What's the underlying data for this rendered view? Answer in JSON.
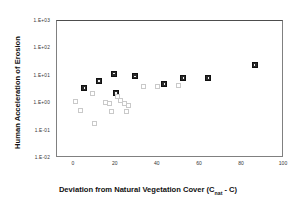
{
  "chart_data": {
    "type": "scatter",
    "title": "",
    "xlabel": "Deviation from Natural Vegetation Cover (Cnat -  C)",
    "xlabel_main": "Deviation from Natural Vegetation Cover (C",
    "xlabel_sub": "nat",
    "xlabel_tail": " -  C)",
    "ylabel": "Human Acceleration of Erosion",
    "xlim": [
      -8,
      100
    ],
    "ylim": [
      0.01,
      1000
    ],
    "yscale": "log",
    "xscale": "linear",
    "grid": false,
    "legend": "none",
    "xticks": [
      "0",
      "20",
      "40",
      "60",
      "80",
      "100"
    ],
    "xtick_values": [
      0,
      20,
      40,
      60,
      80,
      100
    ],
    "yticks": [
      "1.E+03",
      "1.E+02",
      "1.E+01",
      "1.E+00",
      "1.E-01",
      "1.E-02"
    ],
    "ytick_values": [
      1000,
      100,
      10,
      1,
      0.1,
      0.01
    ],
    "series": [
      {
        "name": "filled-squares",
        "marker": "filled-square",
        "color": "#2b2b2b",
        "points": [
          {
            "x": 5,
            "y": 3.6
          },
          {
            "x": 12,
            "y": 6.5
          },
          {
            "x": 19,
            "y": 12.0
          },
          {
            "x": 20,
            "y": 2.4
          },
          {
            "x": 29,
            "y": 9.5
          },
          {
            "x": 43,
            "y": 5.0
          },
          {
            "x": 52,
            "y": 8.5
          },
          {
            "x": 64,
            "y": 8.3
          },
          {
            "x": 86,
            "y": 25.0
          }
        ]
      },
      {
        "name": "open-squares",
        "marker": "open-square",
        "color": "#c9c9c9",
        "points": [
          {
            "x": 1,
            "y": 1.2
          },
          {
            "x": 3,
            "y": 0.55
          },
          {
            "x": 9,
            "y": 2.3
          },
          {
            "x": 10,
            "y": 0.18
          },
          {
            "x": 15,
            "y": 1.05
          },
          {
            "x": 17,
            "y": 0.95
          },
          {
            "x": 18,
            "y": 0.5
          },
          {
            "x": 21,
            "y": 1.8
          },
          {
            "x": 22,
            "y": 1.25
          },
          {
            "x": 24,
            "y": 1.0
          },
          {
            "x": 25,
            "y": 0.48
          },
          {
            "x": 26,
            "y": 0.85
          },
          {
            "x": 33,
            "y": 4.0
          },
          {
            "x": 40,
            "y": 4.2
          },
          {
            "x": 50,
            "y": 4.3
          }
        ]
      }
    ]
  }
}
